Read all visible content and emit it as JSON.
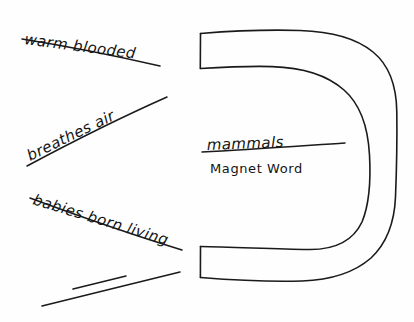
{
  "page": {
    "background_color": "#ffffff",
    "ink_color": "#1a1a1a",
    "width": 414,
    "height": 322
  },
  "center": {
    "magnet_word": "mammals",
    "caption": "Magnet Word"
  },
  "attributes": [
    {
      "label": "warm blooded",
      "slot": 1,
      "filled": true
    },
    {
      "label": "breathes air",
      "slot": 2,
      "filled": true
    },
    {
      "label": "babies born living",
      "slot": 3,
      "filled": true
    },
    {
      "label": "",
      "slot": 4,
      "filled": false
    }
  ],
  "magnet": {
    "shape_name": "horseshoe-magnet",
    "opening": "left",
    "arms": [
      "top-arm",
      "bottom-arm"
    ]
  }
}
